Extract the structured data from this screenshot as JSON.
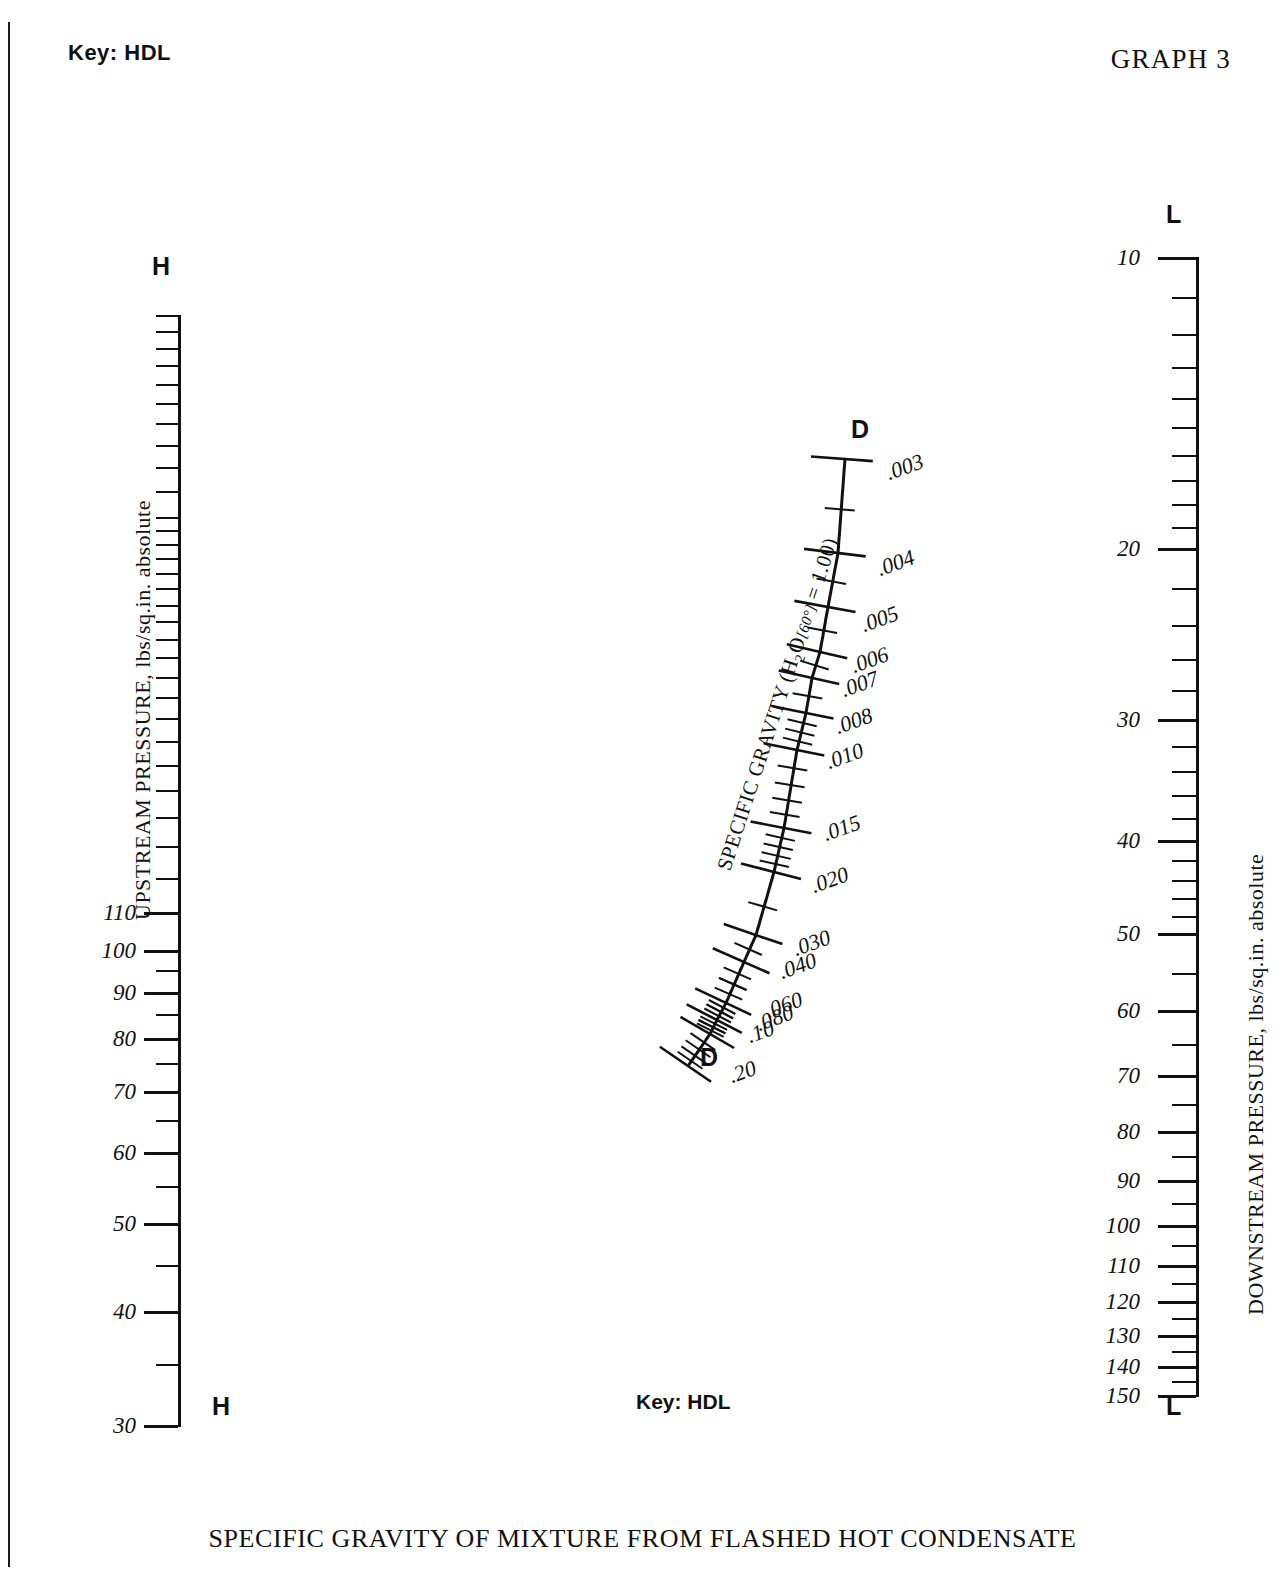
{
  "header": {
    "key_label": "Key: HDL",
    "graph_number": "GRAPH 3"
  },
  "footer": {
    "key_label": "Key: HDL",
    "caption": "SPECIFIC GRAVITY OF MIXTURE FROM FLASHED HOT CONDENSATE"
  },
  "axes": {
    "upstream": {
      "title": "UPSTREAM PRESSURE, lbs/sq.in. absolute",
      "endpoint_top": "H",
      "endpoint_bottom": "H",
      "labels": [
        "110",
        "100",
        "90",
        "80",
        "70",
        "60",
        "50",
        "40",
        "30"
      ]
    },
    "downstream": {
      "title": "DOWNSTREAM PRESSURE, lbs/sq.in. absolute",
      "endpoint_top": "L",
      "endpoint_bottom": "L",
      "labels": [
        "10",
        "20",
        "30",
        "40",
        "50",
        "60",
        "70",
        "80",
        "90",
        "100",
        "110",
        "120",
        "130",
        "140",
        "150"
      ]
    },
    "specific_gravity": {
      "title": "SPECIFIC GRAVITY (H2O[60°] = 1.00)",
      "title_parts": {
        "pre": "SPECIFIC GRAVITY (H",
        "sub": "2",
        "mid": "O",
        "bracket": "[60°]",
        "post": " = 1.00)"
      },
      "endpoint_top": "D",
      "endpoint_bottom": "D",
      "labels": [
        ".003",
        ".004",
        ".005",
        ".006",
        ".007",
        ".008",
        ".010",
        ".015",
        ".020",
        ".030",
        ".040",
        ".060",
        ".080",
        ".10",
        ".20"
      ]
    }
  },
  "chart_data": {
    "type": "line",
    "title": "SPECIFIC GRAVITY OF MIXTURE FROM FLASHED HOT CONDENSATE",
    "subtitle": "GRAPH 3",
    "legend": [
      "Key: HDL"
    ],
    "grid": false,
    "legend_position": "top-left",
    "scales": [
      {
        "name": "UPSTREAM PRESSURE, lbs/sq.in. absolute",
        "key": "H",
        "orientation": "vertical-left",
        "scale_type": "log",
        "range": [
          30,
          500
        ],
        "labeled_ticks": [
          110,
          100,
          90,
          80,
          70,
          60,
          50,
          40,
          30
        ],
        "tick_values": [
          500,
          480,
          460,
          440,
          420,
          400,
          380,
          360,
          340,
          320,
          300,
          290,
          280,
          270,
          260,
          250,
          240,
          230,
          220,
          210,
          200,
          190,
          180,
          170,
          160,
          150,
          140,
          130,
          120,
          110,
          100,
          95,
          90,
          85,
          80,
          75,
          70,
          65,
          60,
          55,
          50,
          45,
          40,
          35,
          30
        ],
        "direction": "increasing-upward"
      },
      {
        "name": "DOWNSTREAM PRESSURE, lbs/sq.in. absolute",
        "key": "L",
        "orientation": "vertical-right",
        "scale_type": "log",
        "range": [
          10,
          150
        ],
        "labeled_ticks": [
          10,
          20,
          30,
          40,
          50,
          60,
          70,
          80,
          90,
          100,
          110,
          120,
          130,
          140,
          150
        ],
        "tick_values": [
          10,
          11,
          12,
          13,
          14,
          15,
          16,
          17,
          18,
          19,
          20,
          22,
          24,
          26,
          28,
          30,
          32,
          34,
          36,
          38,
          40,
          42,
          44,
          46,
          48,
          50,
          55,
          60,
          65,
          70,
          75,
          80,
          85,
          90,
          95,
          100,
          105,
          110,
          115,
          120,
          125,
          130,
          135,
          140,
          145,
          150
        ],
        "direction": "increasing-downward"
      },
      {
        "name": "SPECIFIC GRAVITY (H2O[60deg] = 1.00)",
        "key": "D",
        "orientation": "diagonal",
        "scale_type": "log",
        "range": [
          0.003,
          0.2
        ],
        "labeled_ticks": [
          0.003,
          0.004,
          0.005,
          0.006,
          0.007,
          0.008,
          0.01,
          0.015,
          0.02,
          0.03,
          0.04,
          0.06,
          0.08,
          0.1,
          0.2
        ],
        "reference": "H2O at 60 degrees F = 1.00",
        "direction": "increasing-downward"
      }
    ]
  }
}
